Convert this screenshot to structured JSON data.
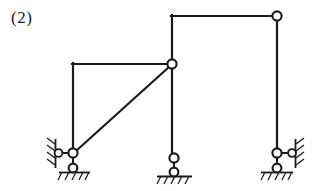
{
  "figure": {
    "label": "(2)",
    "type": "structural-frame-diagram",
    "caption": "",
    "width": 315,
    "height": 191,
    "background_color": "#ffffff",
    "line_color": "#1a1a1a",
    "joint_fill_color": "#ffffff",
    "line_width": 2.2,
    "thin_line_width": 1.4
  },
  "geometry": {
    "members": [
      {
        "name": "left-top-beam",
        "kind": "beam",
        "x1": 73,
        "y1": 64,
        "x2": 172,
        "y2": 64,
        "note": "horizontal beam of left bay, rigid corner at left end"
      },
      {
        "name": "left-column",
        "kind": "column",
        "x1": 73,
        "y1": 64,
        "x2": 73,
        "y2": 153,
        "note": "left column from rigid corner down to left support hinge"
      },
      {
        "name": "diagonal-brace",
        "kind": "brace",
        "x1": 73,
        "y1": 153,
        "x2": 172,
        "y2": 64,
        "note": "diagonal from left support hinge up to central hinge"
      },
      {
        "name": "center-column",
        "kind": "column",
        "x1": 172,
        "y1": 16,
        "x2": 172,
        "y2": 158,
        "note": "tall middle column passing the central hinge down to middle support"
      },
      {
        "name": "right-top-beam",
        "kind": "beam",
        "x1": 172,
        "y1": 16,
        "x2": 277,
        "y2": 16,
        "note": "top beam of right bay, rigid corner at left end, hinge at right end"
      },
      {
        "name": "right-column",
        "kind": "column",
        "x1": 277,
        "y1": 16,
        "x2": 277,
        "y2": 153,
        "note": "right column from top hinge down to right support hinge"
      }
    ],
    "hinges": [
      {
        "name": "central-hinge",
        "cx": 172,
        "cy": 64,
        "r": 4.6
      },
      {
        "name": "top-right-hinge",
        "cx": 277,
        "cy": 16,
        "r": 4.6
      },
      {
        "name": "left-support-hinge",
        "cx": 73,
        "cy": 153,
        "r": 4.6
      },
      {
        "name": "left-wall-link-hinge",
        "cx": 58,
        "cy": 153,
        "r": 4.2
      },
      {
        "name": "left-ground-pin",
        "cx": 73,
        "cy": 168,
        "r": 4.6
      },
      {
        "name": "middle-support-hinge",
        "cx": 174,
        "cy": 158,
        "r": 4.6
      },
      {
        "name": "middle-ground-pin",
        "cx": 174,
        "cy": 172,
        "r": 4.6
      },
      {
        "name": "right-support-hinge",
        "cx": 277,
        "cy": 153,
        "r": 4.6
      },
      {
        "name": "right-wall-link-hinge",
        "cx": 292,
        "cy": 153,
        "r": 4.2
      },
      {
        "name": "right-ground-pin",
        "cx": 277,
        "cy": 168,
        "r": 4.6
      }
    ],
    "links": [
      {
        "name": "left-horizontal-link",
        "x1": 62,
        "y1": 153,
        "x2": 69,
        "y2": 153
      },
      {
        "name": "left-vertical-link",
        "x1": 73,
        "y1": 157,
        "x2": 73,
        "y2": 164
      },
      {
        "name": "middle-vertical-link",
        "x1": 174,
        "y1": 162,
        "x2": 174,
        "y2": 168
      },
      {
        "name": "right-horizontal-link",
        "x1": 281,
        "y1": 153,
        "x2": 288,
        "y2": 153
      },
      {
        "name": "right-vertical-link",
        "x1": 277,
        "y1": 157,
        "x2": 277,
        "y2": 164
      }
    ],
    "ground_lines": [
      {
        "name": "left-ground-line",
        "x1": 59,
        "y1": 172,
        "x2": 90,
        "y2": 172
      },
      {
        "name": "middle-ground-line",
        "x1": 158,
        "y1": 176,
        "x2": 191,
        "y2": 176
      },
      {
        "name": "right-ground-line",
        "x1": 261,
        "y1": 172,
        "x2": 294,
        "y2": 172
      }
    ],
    "wall_lines": [
      {
        "name": "left-wall-line",
        "x1": 55,
        "y1": 140,
        "x2": 55,
        "y2": 167
      },
      {
        "name": "right-wall-line",
        "x1": 296,
        "y1": 140,
        "x2": 296,
        "y2": 167
      }
    ],
    "hatch_groups": [
      {
        "name": "left-wall-hatch",
        "orientation": "vertical-wall",
        "side": "left"
      },
      {
        "name": "left-ground-hatch",
        "orientation": "ground"
      },
      {
        "name": "middle-ground-hatch",
        "orientation": "ground"
      },
      {
        "name": "right-wall-hatch",
        "orientation": "vertical-wall",
        "side": "right"
      },
      {
        "name": "right-ground-hatch",
        "orientation": "ground"
      }
    ]
  },
  "supports": [
    {
      "name": "left-support",
      "type": "hinge-with-horizontal-link-and-ground-pin",
      "location_x": 73,
      "location_y": 153
    },
    {
      "name": "middle-support",
      "type": "hinge-with-vertical-link-to-ground-pin",
      "location_x": 174,
      "location_y": 158
    },
    {
      "name": "right-support",
      "type": "hinge-with-horizontal-link-and-ground-pin",
      "location_x": 277,
      "location_y": 153
    }
  ]
}
